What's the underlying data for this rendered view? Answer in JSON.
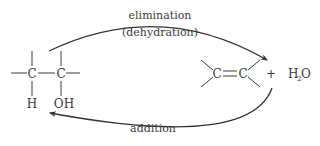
{
  "diagram": {
    "type": "reaction-scheme",
    "forward_arrow": {
      "label_line1": "elimination",
      "label_line2": "(dehydration)"
    },
    "reverse_arrow": {
      "label": "addition"
    },
    "reactant": {
      "name": "alcohol",
      "atom_c1": "C",
      "atom_c2": "C",
      "substituent_c1": "H",
      "substituent_c2": "OH"
    },
    "product": {
      "name": "alkene",
      "atom_c1": "C",
      "atom_c2": "C",
      "plus": "+",
      "water_h": "H",
      "water_sub": "2",
      "water_o": "O"
    },
    "colors": {
      "ink": "#3a3a3a",
      "background": "#ffffff"
    }
  }
}
